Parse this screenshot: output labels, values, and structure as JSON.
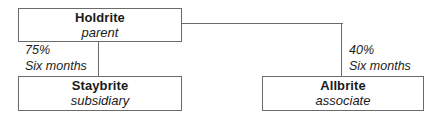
{
  "diagram": {
    "type": "organizational-structure",
    "nodes": {
      "parent": {
        "name": "Holdrite",
        "role": "parent"
      },
      "subsidiary": {
        "name": "Staybrite",
        "role": "subsidiary"
      },
      "associate": {
        "name": "Allbrite",
        "role": "associate"
      }
    },
    "edges": {
      "to_subsidiary": {
        "percent": "75%",
        "period": "Six months"
      },
      "to_associate": {
        "percent": "40%",
        "period": "Six months"
      }
    },
    "colors": {
      "border": "#6a6a6a",
      "text": "#1a1a1a",
      "background": "#ffffff"
    }
  }
}
